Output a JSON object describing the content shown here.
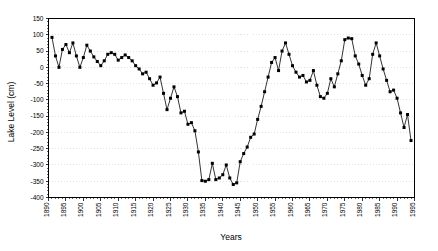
{
  "chart_data": {
    "type": "line",
    "title": "",
    "xlabel": "Years",
    "ylabel": "Lake Level (cm)",
    "xlim": [
      1890,
      1995
    ],
    "ylim": [
      -400,
      150
    ],
    "xticks": [
      1890,
      1895,
      1900,
      1905,
      1910,
      1915,
      1920,
      1925,
      1930,
      1935,
      1940,
      1945,
      1950,
      1955,
      1960,
      1965,
      1970,
      1975,
      1980,
      1985,
      1990,
      1995
    ],
    "yticks": [
      150,
      100,
      50,
      0,
      -50,
      -100,
      -150,
      -200,
      -250,
      -300,
      -350,
      -400
    ],
    "xtick_labels": [
      "1890",
      "1895",
      "1900",
      "1905",
      "1910",
      "1915",
      "1920",
      "1925",
      "1930",
      "1935",
      "1940",
      "1945",
      "1950",
      "1955",
      "1960",
      "1965",
      "1970",
      "1975",
      "1980",
      "1985",
      "1990",
      "1995"
    ],
    "ytick_labels": [
      "150",
      "100",
      "50",
      "0",
      "-50",
      "-100",
      "-150",
      "-200",
      "-250",
      "-300",
      "-350",
      "-400"
    ],
    "grid": true,
    "grid_axis": "y",
    "legend": false,
    "marker": "filled-square",
    "series": [
      {
        "name": "Lake Level",
        "x": [
          1891,
          1892,
          1893,
          1894,
          1895,
          1896,
          1897,
          1898,
          1899,
          1900,
          1901,
          1902,
          1903,
          1904,
          1905,
          1906,
          1907,
          1908,
          1909,
          1910,
          1911,
          1912,
          1913,
          1914,
          1915,
          1916,
          1917,
          1918,
          1919,
          1920,
          1921,
          1922,
          1923,
          1924,
          1925,
          1926,
          1927,
          1928,
          1929,
          1930,
          1931,
          1932,
          1933,
          1934,
          1935,
          1936,
          1937,
          1938,
          1939,
          1940,
          1941,
          1942,
          1943,
          1944,
          1945,
          1946,
          1947,
          1948,
          1949,
          1950,
          1951,
          1952,
          1953,
          1954,
          1955,
          1956,
          1957,
          1958,
          1959,
          1960,
          1961,
          1962,
          1963,
          1964,
          1965,
          1966,
          1967,
          1968,
          1969,
          1970,
          1971,
          1972,
          1973,
          1974,
          1975,
          1976,
          1977,
          1978,
          1979,
          1980,
          1981,
          1982,
          1983,
          1984,
          1985,
          1986,
          1987,
          1988,
          1989,
          1990,
          1991,
          1992,
          1993,
          1994
        ],
        "y": [
          92,
          35,
          0,
          55,
          70,
          45,
          75,
          35,
          0,
          30,
          68,
          50,
          32,
          18,
          5,
          20,
          40,
          45,
          40,
          22,
          30,
          38,
          30,
          20,
          5,
          -5,
          -20,
          -15,
          -35,
          -55,
          -48,
          -30,
          -80,
          -130,
          -95,
          -60,
          -90,
          -140,
          -135,
          -175,
          -170,
          -195,
          -260,
          -348,
          -350,
          -345,
          -295,
          -345,
          -340,
          -330,
          -300,
          -340,
          -360,
          -355,
          -290,
          -265,
          -245,
          -215,
          -205,
          -160,
          -120,
          -75,
          -30,
          15,
          30,
          -10,
          50,
          75,
          40,
          5,
          -15,
          -30,
          -25,
          -45,
          -40,
          -10,
          -55,
          -90,
          -95,
          -80,
          -35,
          -60,
          -20,
          20,
          85,
          90,
          88,
          35,
          10,
          -25,
          -55,
          -35,
          40,
          75,
          35,
          -5,
          -40,
          -75,
          -70,
          -95,
          -140,
          -185,
          -145,
          -225
        ]
      }
    ]
  },
  "axis": {
    "y_title": "Lake Level (cm)",
    "x_title": "Years"
  }
}
